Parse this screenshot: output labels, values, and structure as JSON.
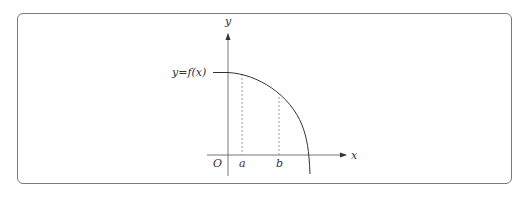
{
  "diagram": {
    "type": "function-graph",
    "axes": {
      "x_label": "x",
      "y_label": "y",
      "origin_label": "O"
    },
    "curve": {
      "label": "y = f(x)",
      "label_text": "y=f(x)",
      "description": "decreasing concave-down curve starting at y-intercept and crossing the positive x-axis"
    },
    "markers": [
      {
        "label": "a"
      },
      {
        "label": "b"
      }
    ],
    "colors": {
      "axis": "#555555",
      "curve": "#333333",
      "dashed": "#888888",
      "frame": "#7a7a7a"
    }
  }
}
